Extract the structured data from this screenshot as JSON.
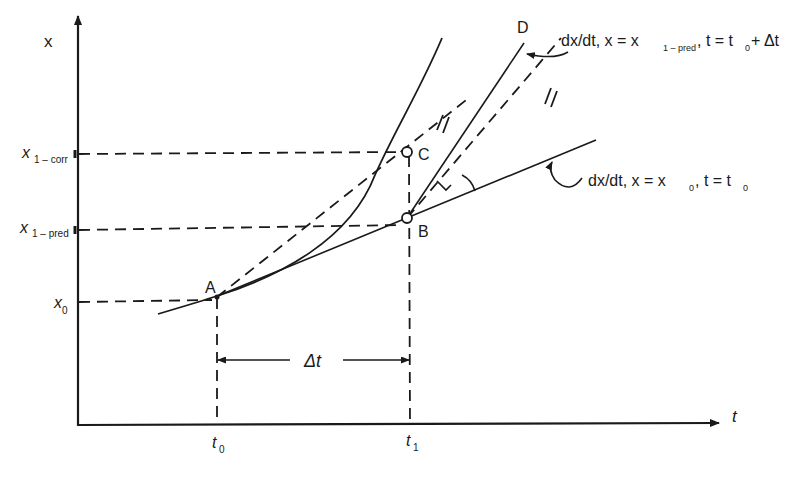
{
  "diagram": {
    "title": "",
    "axes": {
      "y_label": "x",
      "x_label": "t"
    },
    "y_ticks": [
      {
        "id": "x1-corr",
        "main": "x",
        "sub": "1 – corr"
      },
      {
        "id": "x1-pred",
        "main": "x",
        "sub": "1 – pred"
      },
      {
        "id": "x0",
        "main": "x",
        "sub": "0"
      }
    ],
    "x_ticks": [
      {
        "id": "t0",
        "main": "t",
        "sub": "0"
      },
      {
        "id": "t1",
        "main": "t",
        "sub": "1"
      }
    ],
    "points": {
      "A": "A",
      "B": "B",
      "C": "C",
      "D": "D"
    },
    "interval_label": "Δt",
    "annotations": {
      "slope_at_x1pred": {
        "prefix": "dx/dt, x = x",
        "sub": "1 – pred",
        "suffix": ", t = t",
        "sub2": "0",
        "tail": " + Δt"
      },
      "slope_at_x0": {
        "prefix": "dx/dt, x = x",
        "sub": "0",
        "suffix": ", t = t",
        "sub2": "0"
      }
    },
    "colors": {
      "ink": "#1a1a1a",
      "background": "#ffffff"
    }
  }
}
